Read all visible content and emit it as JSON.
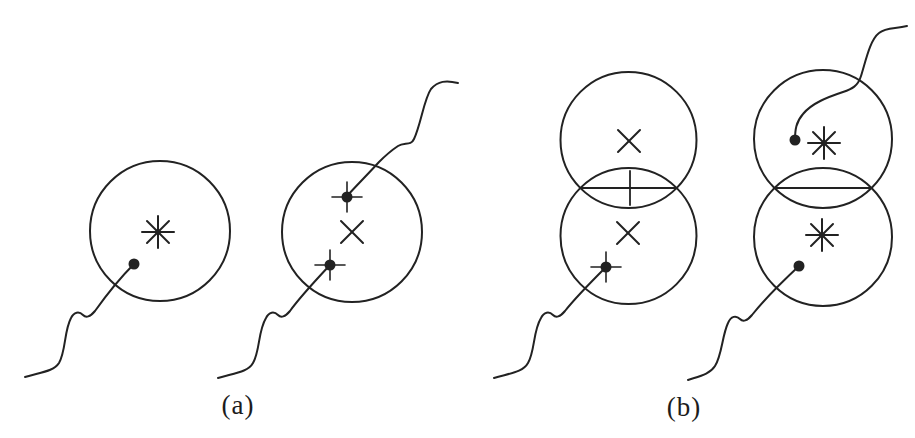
{
  "figure": {
    "ink": "#222222",
    "background": "#ffffff",
    "panel_a": {
      "label": "(a)",
      "shapes": [
        {
          "name": "gate-circle",
          "type": "circle",
          "cx": 160,
          "cy": 231,
          "r": 70
        },
        {
          "name": "asterisk-marker",
          "type": "asterisk",
          "cx": 158,
          "cy": 232,
          "r": 16,
          "d": 11
        },
        {
          "name": "measurement-dot",
          "type": "dot",
          "cx": 134,
          "cy": 264,
          "r": 5.5
        },
        {
          "name": "trajectory-curve",
          "type": "path",
          "d": "M 25 377 C 42 372 54 371 59 363 C 66 351 64 331 71 318 C 74 312 79 311 83 315 C 86 318 90 317 95 311 C 105 297 120 278 134 264"
        },
        {
          "name": "gate-circle",
          "type": "circle",
          "cx": 352,
          "cy": 232,
          "r": 70
        },
        {
          "name": "x-marker",
          "type": "xmark",
          "cx": 352,
          "cy": 232,
          "a": 11
        },
        {
          "name": "measurement-dot-plus",
          "type": "dotplus",
          "cx": 347,
          "cy": 197,
          "r": 5.5,
          "a": 15
        },
        {
          "name": "measurement-dot-plus",
          "type": "dotplus",
          "cx": 330,
          "cy": 265,
          "r": 5.5,
          "a": 15
        },
        {
          "name": "trajectory-curve",
          "type": "path",
          "d": "M 458 83 C 446 80 438 81 431 89 C 424 99 421 124 414 139 C 411 146 404 142 398 146 C 392 150 387 154 379 162 C 369 173 357 185 347 196"
        },
        {
          "name": "trajectory-curve",
          "type": "path",
          "d": "M 218 378 C 235 373 248 372 253 363 C 260 351 258 331 266 318 C 269 312 274 311 278 315 C 281 318 285 317 290 311 C 300 297 316 280 330 265"
        }
      ]
    },
    "panel_b": {
      "label": "(b)",
      "shapes": [
        {
          "name": "gate-circle",
          "type": "circle",
          "cx": 628.5,
          "cy": 140,
          "r": 68
        },
        {
          "name": "gate-circle",
          "type": "circle",
          "cx": 628.5,
          "cy": 236,
          "r": 68
        },
        {
          "name": "intersection-chord",
          "type": "line",
          "x1": 580,
          "y1": 188,
          "x2": 677,
          "y2": 188
        },
        {
          "name": "plus-marker",
          "type": "plus",
          "cx": 630,
          "cy": 188,
          "ax": 16,
          "ay": 17
        },
        {
          "name": "x-marker",
          "type": "xmark",
          "cx": 629,
          "cy": 141,
          "a": 11
        },
        {
          "name": "x-marker",
          "type": "xmark",
          "cx": 628,
          "cy": 233,
          "a": 11
        },
        {
          "name": "measurement-dot-plus",
          "type": "dotplus",
          "cx": 606,
          "cy": 267,
          "r": 5.5,
          "a": 15
        },
        {
          "name": "trajectory-curve",
          "type": "path",
          "d": "M 494 378 C 511 373 523 372 528 363 C 535 351 533 331 541 318 C 544 312 549 311 553 315 C 556 318 560 317 565 311 C 576 297 592 281 606 267"
        },
        {
          "name": "gate-circle",
          "type": "circle",
          "cx": 823,
          "cy": 139,
          "r": 69
        },
        {
          "name": "gate-circle",
          "type": "circle",
          "cx": 823,
          "cy": 237,
          "r": 69
        },
        {
          "name": "intersection-chord",
          "type": "line",
          "x1": 774,
          "y1": 188,
          "x2": 872,
          "y2": 188
        },
        {
          "name": "measurement-dot",
          "type": "dot",
          "cx": 795,
          "cy": 140,
          "r": 5.5
        },
        {
          "name": "asterisk-marker",
          "type": "asterisk",
          "cx": 824,
          "cy": 143,
          "r": 16,
          "d": 11
        },
        {
          "name": "asterisk-marker",
          "type": "asterisk",
          "cx": 822,
          "cy": 235,
          "r": 16,
          "d": 11
        },
        {
          "name": "measurement-dot",
          "type": "dot",
          "cx": 799,
          "cy": 266,
          "r": 5.5
        },
        {
          "name": "trajectory-curve",
          "type": "path",
          "d": "M 907 26 C 895 29 886 27 879 33 C 870 40 866 60 861 76 C 858 86 852 89 843 92 C 828 97 812 103 803 114 C 796 122 795 130 795 140"
        },
        {
          "name": "trajectory-curve",
          "type": "path",
          "d": "M 688 380 C 700 376 710 374 715 366 C 722 355 722 336 728 323 C 731 316 736 315 740 319 C 743 322 747 321 752 315 C 763 301 783 281 799 266"
        }
      ]
    }
  }
}
